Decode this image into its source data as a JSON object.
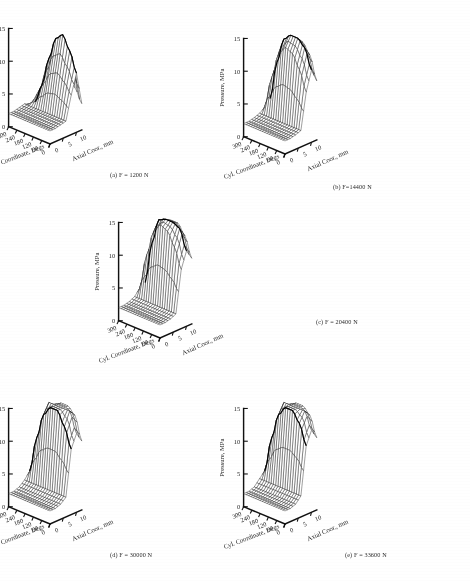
{
  "figure": {
    "background": "#ffffff",
    "ink": "#1a1a1a",
    "panel_count": 5
  },
  "axes": {
    "z_label": "Pressure, MPa",
    "z_ticks": [
      "0",
      "5",
      "10",
      "15"
    ],
    "z_values": [
      0,
      5,
      10,
      15
    ],
    "x_label": "Cyl. Coordinate, Degs",
    "x_ticks": [
      "300",
      "240",
      "180",
      "120",
      "60",
      "0"
    ],
    "x_values": [
      300,
      240,
      180,
      120,
      60,
      0
    ],
    "y_label": "Axial Coor., mm",
    "y_ticks": [
      "0",
      "5",
      "10"
    ],
    "y_values": [
      0,
      5,
      10
    ]
  },
  "panels": [
    {
      "id": "a",
      "caption": "(a) F = 1200 N",
      "force_n": 1200,
      "peak_mpa": 14.0
    },
    {
      "id": "b",
      "caption": "(b) F=14400 N",
      "force_n": 14400,
      "peak_mpa": 15.0
    },
    {
      "id": "c",
      "caption": "(c) F = 20400 N",
      "force_n": 20400,
      "peak_mpa": 15.0
    },
    {
      "id": "d",
      "caption": "(d) F = 30000 N",
      "force_n": 30000,
      "peak_mpa": 15.0
    },
    {
      "id": "e",
      "caption": "(e) F = 33600 N",
      "force_n": 33600,
      "peak_mpa": 15.0
    }
  ],
  "chart_data": {
    "type": "surface",
    "title": "",
    "xlabel": "Cyl. Coordinate, Degs",
    "ylabel": "Axial Coor., mm",
    "zlabel": "Pressure, MPa",
    "xlim": [
      0,
      360
    ],
    "ylim": [
      0,
      12
    ],
    "zlim": [
      0,
      15
    ],
    "grid": false,
    "legend": "none",
    "projection": "3d-wireframe",
    "x": [
      0,
      60,
      120,
      180,
      240,
      300,
      360
    ],
    "y": [
      0,
      2,
      4,
      6,
      8,
      10,
      12
    ],
    "panels": [
      {
        "id": "a",
        "caption": "(a) F = 1200 N",
        "force_n": 1200,
        "description": "Single broad ridge near 0-60 degrees rising to about 14 MPa, flat low plateau near 2 MPa across 120-360 degrees",
        "surface": [
          [
            2.0,
            2.0,
            2.0,
            2.0,
            2.0,
            2.0,
            2.0
          ],
          [
            2.0,
            2.0,
            2.0,
            2.0,
            2.0,
            2.0,
            2.0
          ],
          [
            2.2,
            2.2,
            2.2,
            2.2,
            2.2,
            2.2,
            2.2
          ],
          [
            2.4,
            2.4,
            2.4,
            2.4,
            2.4,
            2.4,
            2.4
          ],
          [
            6.0,
            7.5,
            8.5,
            8.0,
            6.0,
            3.5,
            2.0
          ],
          [
            9.0,
            12.0,
            14.0,
            13.0,
            9.5,
            5.0,
            2.0
          ],
          [
            4.0,
            6.0,
            7.0,
            6.5,
            4.5,
            2.5,
            1.0
          ]
        ]
      },
      {
        "id": "b",
        "caption": "(b) F=14400 N",
        "force_n": 14400,
        "description": "Tall double ridge spanning 0-120 degrees reaching 15 MPa with steep drop-off, low plateau near 2 MPa beyond 180 degrees",
        "surface": [
          [
            2.0,
            2.0,
            2.0,
            2.0,
            2.0,
            2.0,
            2.0
          ],
          [
            2.0,
            2.0,
            2.0,
            2.0,
            2.0,
            2.0,
            2.0
          ],
          [
            2.2,
            2.2,
            2.2,
            2.2,
            2.2,
            2.2,
            2.2
          ],
          [
            2.5,
            2.5,
            2.5,
            2.5,
            2.5,
            2.5,
            2.5
          ],
          [
            8.0,
            11.0,
            13.0,
            13.5,
            12.0,
            8.0,
            3.0
          ],
          [
            11.0,
            14.0,
            15.0,
            15.0,
            14.0,
            10.0,
            4.0
          ],
          [
            9.0,
            12.5,
            14.0,
            14.0,
            12.5,
            8.5,
            3.0
          ]
        ]
      },
      {
        "id": "c",
        "caption": "(c) F = 20400 N",
        "force_n": 20400,
        "description": "Sharp tall ridge near 60-120 degrees reaching 15 MPa, deep trough immediately adjacent, flat plateau near 2 MPa",
        "surface": [
          [
            2.0,
            2.0,
            2.0,
            2.0,
            2.0,
            2.0,
            2.0
          ],
          [
            2.0,
            2.0,
            2.0,
            2.0,
            2.0,
            2.0,
            2.0
          ],
          [
            2.2,
            2.2,
            2.2,
            2.2,
            2.2,
            2.2,
            2.2
          ],
          [
            2.6,
            2.6,
            2.6,
            2.6,
            2.6,
            2.6,
            2.6
          ],
          [
            9.0,
            12.0,
            14.0,
            14.5,
            13.0,
            9.0,
            3.5
          ],
          [
            11.5,
            14.5,
            15.0,
            15.0,
            14.5,
            10.5,
            4.0
          ],
          [
            10.0,
            13.0,
            14.5,
            14.5,
            13.0,
            9.0,
            3.5
          ]
        ]
      },
      {
        "id": "d",
        "caption": "(d) F = 30000 N",
        "force_n": 30000,
        "description": "Wide twin-peaked ridge spanning 60-180 degrees at 15 MPa with pronounced central valley, low plateau near 2 MPa",
        "surface": [
          [
            2.0,
            2.0,
            2.0,
            2.0,
            2.0,
            2.0,
            2.0
          ],
          [
            2.0,
            2.0,
            2.0,
            2.0,
            2.0,
            2.0,
            2.0
          ],
          [
            2.3,
            2.3,
            2.3,
            2.3,
            2.3,
            2.3,
            2.3
          ],
          [
            3.0,
            3.0,
            3.0,
            3.0,
            3.0,
            3.0,
            3.0
          ],
          [
            10.0,
            13.0,
            15.0,
            15.0,
            13.5,
            9.5,
            4.0
          ],
          [
            12.0,
            15.0,
            15.0,
            15.0,
            15.0,
            11.0,
            4.5
          ],
          [
            10.5,
            14.0,
            15.0,
            15.0,
            14.0,
            10.0,
            4.0
          ]
        ]
      },
      {
        "id": "e",
        "caption": "(e) F = 33600 N",
        "force_n": 33600,
        "description": "Broad high ridge from 60 to 180 degrees at 15 MPa, smoother crest than panel d, low plateau near 2 MPa",
        "surface": [
          [
            2.0,
            2.0,
            2.0,
            2.0,
            2.0,
            2.0,
            2.0
          ],
          [
            2.0,
            2.0,
            2.0,
            2.0,
            2.0,
            2.0,
            2.0
          ],
          [
            2.3,
            2.3,
            2.3,
            2.3,
            2.3,
            2.3,
            2.3
          ],
          [
            3.2,
            3.2,
            3.2,
            3.2,
            3.2,
            3.2,
            3.2
          ],
          [
            10.5,
            13.5,
            15.0,
            15.0,
            13.5,
            9.5,
            4.0
          ],
          [
            12.5,
            15.0,
            15.0,
            15.0,
            15.0,
            11.0,
            4.5
          ],
          [
            11.0,
            14.0,
            15.0,
            15.0,
            14.0,
            10.0,
            4.0
          ]
        ]
      }
    ]
  }
}
